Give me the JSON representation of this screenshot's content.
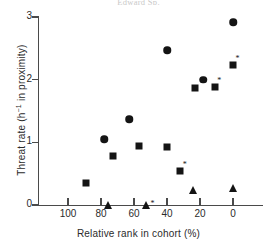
{
  "header": {
    "caption": "Edward Sp."
  },
  "axes": {
    "x_title": "Relative rank in cohort (%)",
    "y_title_pre": "Threat rate (h",
    "y_title_sup": "−1",
    "y_title_post": " in proximity)",
    "x_ticks": [
      "100",
      "80",
      "60",
      "40",
      "20",
      "0"
    ],
    "y_ticks": [
      "3",
      "2",
      "1",
      "0"
    ],
    "xlim": [
      110,
      -5
    ],
    "ylim": [
      0,
      3
    ],
    "grid": false
  },
  "chart_data": {
    "type": "scatter",
    "title": "",
    "xlabel": "Relative rank in cohort (%)",
    "ylabel": "Threat rate (h−1 in proximity)",
    "xlim": [
      110,
      -5
    ],
    "ylim": [
      0,
      3
    ],
    "x_ticks": [
      100,
      80,
      60,
      40,
      20,
      0
    ],
    "y_ticks": [
      0,
      1,
      2,
      3
    ],
    "x_axis_reversed": true,
    "grid": false,
    "legend": null,
    "marker_types": [
      "circle",
      "square",
      "triangle"
    ],
    "annotation_symbol": "*",
    "points": [
      {
        "x": 0,
        "y": 2.92,
        "marker": "circle",
        "asterisk": false
      },
      {
        "x": 0,
        "y": 2.23,
        "marker": "square",
        "asterisk": true
      },
      {
        "x": 0,
        "y": 0.27,
        "marker": "triangle",
        "asterisk": false
      },
      {
        "x": 11,
        "y": 1.88,
        "marker": "square",
        "asterisk": true
      },
      {
        "x": 18,
        "y": 2.0,
        "marker": "circle",
        "asterisk": false
      },
      {
        "x": 23,
        "y": 1.87,
        "marker": "square",
        "asterisk": false
      },
      {
        "x": 24,
        "y": 0.24,
        "marker": "triangle",
        "asterisk": false
      },
      {
        "x": 32,
        "y": 0.54,
        "marker": "square",
        "asterisk": true
      },
      {
        "x": 40,
        "y": 2.47,
        "marker": "circle",
        "asterisk": false
      },
      {
        "x": 40,
        "y": 0.92,
        "marker": "square",
        "asterisk": false
      },
      {
        "x": 53,
        "y": 0.0,
        "marker": "triangle",
        "asterisk": true
      },
      {
        "x": 57,
        "y": 0.94,
        "marker": "square",
        "asterisk": false
      },
      {
        "x": 63,
        "y": 1.37,
        "marker": "circle",
        "asterisk": false
      },
      {
        "x": 73,
        "y": 0.78,
        "marker": "square",
        "asterisk": false
      },
      {
        "x": 76,
        "y": 0.0,
        "marker": "triangle",
        "asterisk": false
      },
      {
        "x": 78,
        "y": 1.05,
        "marker": "circle",
        "asterisk": false
      },
      {
        "x": 89,
        "y": 0.35,
        "marker": "square",
        "asterisk": false
      }
    ]
  },
  "colors": {
    "marker": "#141414",
    "axis": "#4a4a4a",
    "text": "#2b2b2b",
    "background": "#ffffff"
  }
}
